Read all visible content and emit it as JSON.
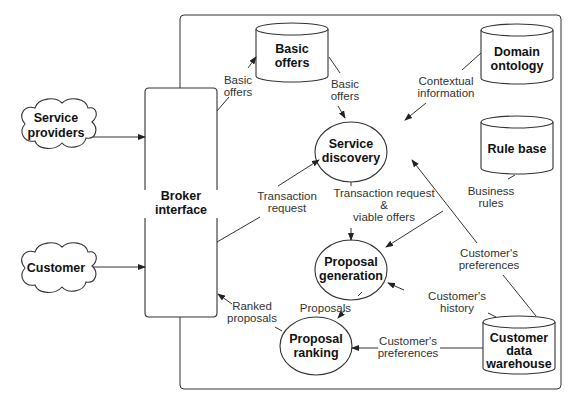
{
  "diagram": {
    "external_actors": [
      {
        "id": "service-providers",
        "lines": [
          "Service",
          "providers"
        ]
      },
      {
        "id": "customer",
        "lines": [
          "Customer"
        ]
      }
    ],
    "broker_interface": {
      "lines": [
        "Broker",
        "interface"
      ]
    },
    "data_stores": [
      {
        "id": "basic-offers",
        "lines": [
          "Basic",
          "offers"
        ]
      },
      {
        "id": "domain-ontology",
        "lines": [
          "Domain",
          "ontology"
        ]
      },
      {
        "id": "rule-base",
        "lines": [
          "Rule base"
        ]
      },
      {
        "id": "customer-data-warehouse",
        "lines": [
          "Customer",
          "data",
          "warehouse"
        ]
      }
    ],
    "processes": [
      {
        "id": "service-discovery",
        "lines": [
          "Service",
          "discovery"
        ]
      },
      {
        "id": "proposal-generation",
        "lines": [
          "Proposal",
          "generation"
        ]
      },
      {
        "id": "proposal-ranking",
        "lines": [
          "Proposal",
          "ranking"
        ]
      }
    ],
    "flows": [
      {
        "from": "service-providers",
        "to": "broker-interface",
        "label": []
      },
      {
        "from": "customer",
        "to": "broker-interface",
        "label": []
      },
      {
        "from": "broker-interface",
        "to": "basic-offers",
        "label": [
          "Basic",
          "offers"
        ]
      },
      {
        "from": "basic-offers",
        "to": "service-discovery",
        "label": [
          "Basic",
          "offers"
        ]
      },
      {
        "from": "domain-ontology",
        "to": "service-discovery",
        "label": [
          "Contextual",
          "information"
        ]
      },
      {
        "from": "broker-interface",
        "to": "service-discovery",
        "label": [
          "Transaction",
          "request"
        ]
      },
      {
        "from": "service-discovery",
        "to": "proposal-generation",
        "label": [
          "Transaction request",
          "&",
          "viable offers"
        ]
      },
      {
        "from": "rule-base",
        "to": "proposal-generation",
        "label": [
          "Business",
          "rules"
        ]
      },
      {
        "from": "customer-data-warehouse",
        "to": "service-discovery",
        "label": [
          "Customer's",
          "preferences"
        ]
      },
      {
        "from": "customer-data-warehouse",
        "to": "proposal-generation",
        "label": [
          "Customer's",
          "history"
        ]
      },
      {
        "from": "proposal-generation",
        "to": "proposal-ranking",
        "label": [
          "Proposals"
        ]
      },
      {
        "from": "customer-data-warehouse",
        "to": "proposal-ranking",
        "label": [
          "Customer's",
          "preferences"
        ]
      },
      {
        "from": "proposal-ranking",
        "to": "broker-interface",
        "label": [
          "Ranked",
          "proposals"
        ]
      }
    ]
  }
}
